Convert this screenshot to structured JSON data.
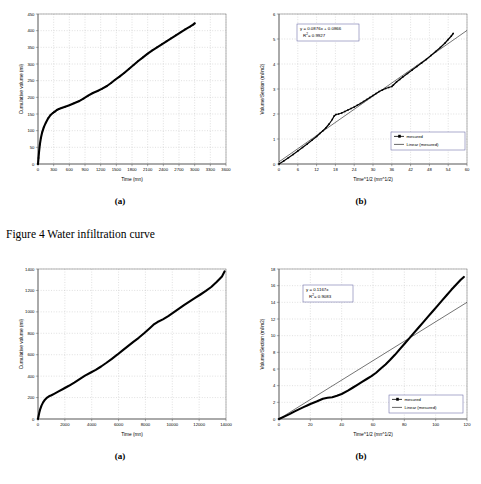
{
  "figure": {
    "caption": "Figure 4 Water infiltration curve",
    "sublabel_a": "(a)",
    "sublabel_b": "(b)"
  },
  "chart_data": [
    {
      "id": "top-a",
      "type": "line",
      "title": "",
      "xlabel": "Time (mn)",
      "ylabel": "Cumulative volume (ml)",
      "xlim": [
        0,
        3600
      ],
      "ylim": [
        0,
        450
      ],
      "xticks": [
        0,
        300,
        600,
        900,
        1200,
        1500,
        1800,
        2100,
        2400,
        2700,
        3000,
        3300,
        3600
      ],
      "yticks": [
        0,
        50,
        100,
        150,
        200,
        250,
        300,
        350,
        400,
        450
      ],
      "grid": true,
      "legend": null,
      "series": [
        {
          "name": "measured",
          "x": [
            0,
            10,
            20,
            35,
            55,
            80,
            110,
            150,
            195,
            240,
            285,
            310,
            330,
            360,
            400,
            450,
            520,
            600,
            690,
            780,
            870,
            960,
            1050,
            1140,
            1230,
            1320,
            1400,
            1470,
            1560,
            1650,
            1740,
            1830,
            1920,
            2010,
            2100,
            2190,
            2280,
            2370,
            2460,
            2550,
            2640,
            2730,
            2820,
            2910,
            2970,
            3000
          ],
          "y": [
            0,
            18,
            36,
            58,
            78,
            95,
            110,
            124,
            137,
            147,
            153,
            156,
            158,
            162,
            165,
            168,
            172,
            176,
            182,
            188,
            196,
            205,
            213,
            219,
            226,
            234,
            243,
            252,
            262,
            273,
            285,
            297,
            309,
            320,
            331,
            341,
            350,
            359,
            368,
            377,
            386,
            395,
            404,
            412,
            418,
            422
          ]
        }
      ]
    },
    {
      "id": "top-b",
      "type": "scatter",
      "title": "",
      "xlabel": "Time^1/2 (mn^1/2)",
      "ylabel": "Volume/Section (ml/m2)",
      "xlim": [
        0,
        60
      ],
      "ylim": [
        0,
        6
      ],
      "xticks": [
        0,
        6,
        12,
        18,
        24,
        30,
        36,
        42,
        48,
        54,
        60
      ],
      "yticks": [
        0,
        1,
        2,
        3,
        4,
        5,
        6
      ],
      "grid": true,
      "equation": "y = 0.0876x + 0.0866",
      "r_squared": "R  = 0.9927",
      "r_squared_sup": "2",
      "fit": {
        "slope": 0.0876,
        "intercept": 0.0866
      },
      "legend": {
        "position": "lower-right",
        "entries": [
          {
            "label": "mesured",
            "style": "line-marker"
          },
          {
            "label": "Linear (mesured)",
            "style": "line"
          }
        ]
      },
      "series": [
        {
          "name": "mesured",
          "x": [
            0,
            1.5,
            3,
            4.5,
            6,
            7.5,
            9,
            10.5,
            12,
            13,
            14,
            15,
            16,
            17,
            17.6,
            18.2,
            19,
            20,
            21,
            22,
            23,
            24,
            25,
            26,
            27,
            28,
            29,
            30,
            31,
            32,
            33,
            34,
            35,
            36,
            36.5,
            37.5,
            38.5,
            39.5,
            41,
            42.5,
            44,
            45.5,
            47,
            48.5,
            50,
            51.5,
            53,
            54,
            55,
            55.6
          ],
          "y": [
            0,
            0.12,
            0.25,
            0.38,
            0.52,
            0.66,
            0.8,
            0.95,
            1.1,
            1.22,
            1.33,
            1.45,
            1.6,
            1.78,
            1.92,
            1.98,
            2.0,
            2.04,
            2.1,
            2.16,
            2.22,
            2.28,
            2.35,
            2.42,
            2.5,
            2.58,
            2.66,
            2.74,
            2.82,
            2.9,
            2.96,
            3.02,
            3.06,
            3.1,
            3.16,
            3.28,
            3.38,
            3.48,
            3.62,
            3.76,
            3.9,
            4.04,
            4.18,
            4.34,
            4.5,
            4.66,
            4.84,
            4.98,
            5.12,
            5.22
          ]
        }
      ]
    },
    {
      "id": "bottom-a",
      "type": "line",
      "title": "",
      "xlabel": "Time (mn)",
      "ylabel": "Cumulative volume (ml)",
      "xlim": [
        0,
        14000
      ],
      "ylim": [
        0,
        1400
      ],
      "xticks": [
        0,
        2000,
        4000,
        6000,
        8000,
        10000,
        12000,
        14000
      ],
      "yticks": [
        0,
        200,
        400,
        600,
        800,
        1000,
        1200,
        1400
      ],
      "grid": true,
      "legend": null,
      "series": [
        {
          "name": "measured",
          "x": [
            0,
            40,
            90,
            160,
            260,
            380,
            520,
            680,
            820,
            1000,
            1200,
            1500,
            1900,
            2300,
            2700,
            3100,
            3500,
            3900,
            4300,
            4700,
            5100,
            5500,
            5900,
            6300,
            6700,
            7100,
            7500,
            7900,
            8300,
            8600,
            8900,
            9300,
            9700,
            10100,
            10500,
            10900,
            11300,
            11700,
            12100,
            12500,
            12900,
            13300,
            13700,
            13900
          ],
          "y": [
            0,
            25,
            55,
            90,
            125,
            155,
            180,
            200,
            212,
            222,
            235,
            255,
            282,
            310,
            340,
            372,
            405,
            432,
            458,
            490,
            525,
            562,
            600,
            640,
            680,
            720,
            758,
            800,
            845,
            880,
            905,
            930,
            960,
            995,
            1030,
            1065,
            1098,
            1130,
            1162,
            1195,
            1232,
            1278,
            1330,
            1378
          ]
        }
      ]
    },
    {
      "id": "bottom-b",
      "type": "scatter",
      "title": "",
      "xlabel": "Time^1/2 (mn^1/2)",
      "ylabel": "Volume/Section (ml/m2)",
      "xlim": [
        0,
        120
      ],
      "ylim": [
        0,
        18
      ],
      "xticks": [
        0,
        20,
        40,
        60,
        80,
        100,
        120
      ],
      "yticks": [
        0,
        2,
        4,
        6,
        8,
        10,
        12,
        14,
        16,
        18
      ],
      "grid": true,
      "equation": "y = 0.1167x",
      "r_squared": "R  = 0.9083",
      "r_squared_sup": "2",
      "fit": {
        "slope": 0.1167,
        "intercept": 0
      },
      "legend": {
        "position": "lower-right",
        "entries": [
          {
            "label": "mesured",
            "style": "line-marker"
          },
          {
            "label": "Linear (mesured)",
            "style": "line"
          }
        ]
      },
      "series": [
        {
          "name": "mesured",
          "x": [
            0,
            4,
            7,
            10,
            13,
            16,
            18,
            20,
            24,
            28,
            31,
            34,
            37,
            40,
            44,
            47,
            50,
            53,
            56,
            59,
            62,
            65,
            68,
            71,
            74,
            77,
            80,
            83,
            86,
            89,
            92,
            95,
            98,
            101,
            104,
            107,
            110,
            113,
            116,
            118
          ],
          "y": [
            0,
            0.35,
            0.62,
            0.92,
            1.18,
            1.45,
            1.62,
            1.8,
            2.1,
            2.42,
            2.55,
            2.62,
            2.78,
            3.0,
            3.4,
            3.75,
            4.1,
            4.45,
            4.8,
            5.15,
            5.55,
            6.05,
            6.55,
            7.1,
            7.7,
            8.35,
            9.0,
            9.65,
            10.3,
            10.95,
            11.6,
            12.25,
            12.9,
            13.55,
            14.2,
            14.85,
            15.5,
            16.1,
            16.7,
            17.05
          ]
        }
      ]
    }
  ]
}
